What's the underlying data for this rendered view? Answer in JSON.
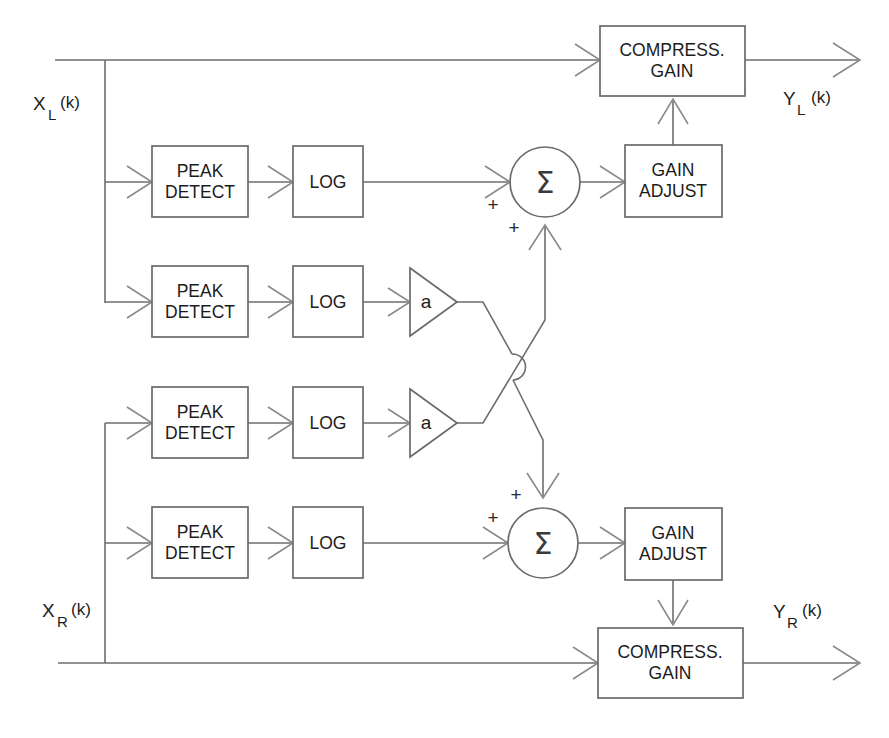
{
  "figure": {
    "type": "block-diagram",
    "domain": "signal-processing",
    "canvas": {
      "width": 889,
      "height": 738
    },
    "background_color": "#ffffff",
    "line_color": "#6e6e6e",
    "text_color": "#1c1c1c"
  },
  "signals": {
    "input_left": {
      "base": "X",
      "subscript": "L",
      "arg": "(k)"
    },
    "input_right": {
      "base": "X",
      "subscript": "R",
      "arg": "(k)"
    },
    "output_left": {
      "base": "Y",
      "subscript": "L",
      "arg": "(k)"
    },
    "output_right": {
      "base": "Y",
      "subscript": "R",
      "arg": "(k)"
    }
  },
  "blocks": {
    "peak_detect": {
      "line1": "PEAK",
      "line2": "DETECT"
    },
    "log": {
      "line1": "LOG"
    },
    "gain_adjust": {
      "line1": "GAIN",
      "line2": "ADJUST"
    },
    "compress_gain": {
      "line1": "COMPRESS.",
      "line2": "GAIN"
    },
    "amplifier": {
      "label": "a"
    },
    "summer": {
      "label": "Σ"
    }
  },
  "signs": {
    "plus": "+"
  },
  "chains": [
    {
      "id": "left-direct-path",
      "channel": "left",
      "nodes": [
        "input_left",
        "compress_gain",
        "output_left"
      ]
    },
    {
      "id": "left-own-sidechain",
      "channel": "left",
      "nodes": [
        "input_left",
        "peak_detect",
        "log",
        "summer_left"
      ]
    },
    {
      "id": "left-cross-sidechain",
      "channel": "left",
      "nodes": [
        "input_left",
        "peak_detect",
        "log",
        "amplifier_a",
        "summer_right"
      ]
    },
    {
      "id": "right-cross-sidechain",
      "channel": "right",
      "nodes": [
        "input_right",
        "peak_detect",
        "log",
        "amplifier_a",
        "summer_left"
      ]
    },
    {
      "id": "right-own-sidechain",
      "channel": "right",
      "nodes": [
        "input_right",
        "peak_detect",
        "log",
        "summer_right"
      ]
    },
    {
      "id": "right-direct-path",
      "channel": "right",
      "nodes": [
        "input_right",
        "compress_gain",
        "output_right"
      ]
    },
    {
      "id": "left-control",
      "channel": "left",
      "nodes": [
        "summer_left",
        "gain_adjust",
        "compress_gain"
      ]
    },
    {
      "id": "right-control",
      "channel": "right",
      "nodes": [
        "summer_right",
        "gain_adjust",
        "compress_gain"
      ]
    }
  ],
  "summer_inputs": {
    "left": [
      {
        "source": "log_row1",
        "sign": "+"
      },
      {
        "source": "amplifier_a_row3",
        "sign": "+"
      }
    ],
    "right": [
      {
        "source": "amplifier_a_row2",
        "sign": "+"
      },
      {
        "source": "log_row4",
        "sign": "+"
      }
    ]
  }
}
